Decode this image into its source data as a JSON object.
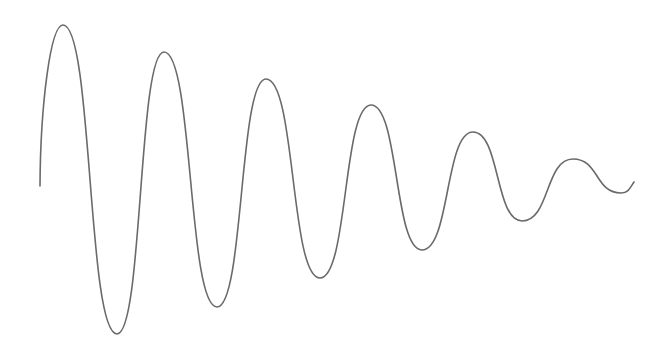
{
  "diagram": {
    "title": "",
    "description": "Damped oscillation waveform sketch",
    "stroke_color": "#6a6a6a",
    "background_color": "#ffffff",
    "stroke_width": 1.6,
    "start_point": [
      40,
      186
    ],
    "extrema": [
      {
        "type": "peak",
        "x": 63,
        "y": 25
      },
      {
        "type": "trough",
        "x": 117,
        "y": 334
      },
      {
        "type": "peak",
        "x": 164,
        "y": 52
      },
      {
        "type": "trough",
        "x": 217,
        "y": 307
      },
      {
        "type": "peak",
        "x": 266,
        "y": 79
      },
      {
        "type": "trough",
        "x": 320,
        "y": 278
      },
      {
        "type": "peak",
        "x": 371,
        "y": 105
      },
      {
        "type": "trough",
        "x": 422,
        "y": 250
      },
      {
        "type": "peak",
        "x": 473,
        "y": 132
      },
      {
        "type": "trough",
        "x": 522,
        "y": 221
      },
      {
        "type": "peak",
        "x": 573,
        "y": 159
      },
      {
        "type": "trough",
        "x": 621,
        "y": 193
      }
    ],
    "end_point": [
      634,
      182
    ]
  }
}
